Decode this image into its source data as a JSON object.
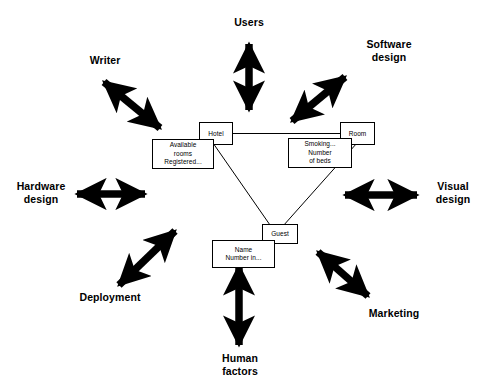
{
  "diagram": {
    "title": "",
    "background_color": "#ffffff",
    "ink_color": "#000000",
    "entities": [
      {
        "id": "hotel",
        "label": "Hotel"
      },
      {
        "id": "room",
        "label": "Room"
      },
      {
        "id": "guest",
        "label": "Guest"
      }
    ],
    "attribute_boxes": [
      {
        "id": "hotel-attrs",
        "owner": "Hotel",
        "text": "Available\nrooms\nRegistered..."
      },
      {
        "id": "room-attrs",
        "owner": "Room",
        "text": "Smoking...\nNumber\nof beds"
      },
      {
        "id": "guest-attrs",
        "owner": "Guest",
        "text": "Name\nNumber in..."
      }
    ],
    "relationships": [
      {
        "from": "Hotel",
        "to": "Room"
      },
      {
        "from": "Hotel",
        "to": "Guest"
      },
      {
        "from": "Room",
        "to": "Guest"
      }
    ],
    "stakeholders": [
      {
        "id": "users",
        "label": "Users",
        "direction": "north"
      },
      {
        "id": "software-design",
        "label": "Software\ndesign",
        "direction": "northeast"
      },
      {
        "id": "visual-design",
        "label": "Visual\ndesign",
        "direction": "east"
      },
      {
        "id": "marketing",
        "label": "Marketing",
        "direction": "southeast"
      },
      {
        "id": "human-factors",
        "label": "Human\nfactors",
        "direction": "south"
      },
      {
        "id": "deployment",
        "label": "Deployment",
        "direction": "southwest"
      },
      {
        "id": "hardware-design",
        "label": "Hardware\ndesign",
        "direction": "west"
      },
      {
        "id": "writer",
        "label": "Writer",
        "direction": "northwest"
      }
    ],
    "arrows": [
      {
        "id": "arrow-north",
        "points_to": "Users",
        "style": "double-headed"
      },
      {
        "id": "arrow-northeast",
        "points_to": "Software design",
        "style": "double-headed"
      },
      {
        "id": "arrow-east",
        "points_to": "Visual design",
        "style": "double-headed"
      },
      {
        "id": "arrow-southeast",
        "points_to": "Marketing",
        "style": "double-headed"
      },
      {
        "id": "arrow-south",
        "points_to": "Human factors",
        "style": "double-headed"
      },
      {
        "id": "arrow-southwest",
        "points_to": "Deployment",
        "style": "double-headed"
      },
      {
        "id": "arrow-west",
        "points_to": "Hardware design",
        "style": "double-headed"
      },
      {
        "id": "arrow-northwest",
        "points_to": "Writer",
        "style": "double-headed"
      }
    ]
  }
}
